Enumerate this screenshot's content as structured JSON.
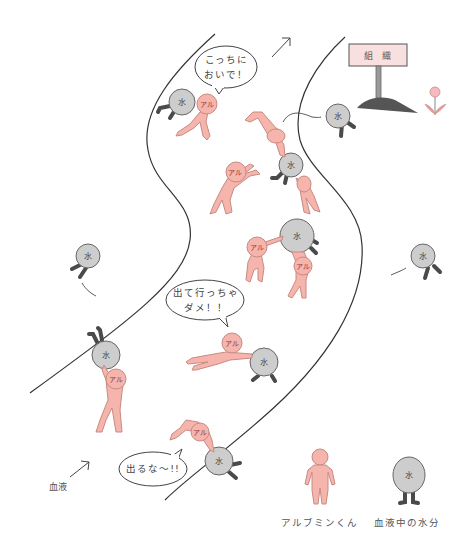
{
  "scene": {
    "title": "Albumin keeps water in the blood vessel",
    "sign": {
      "label": "組 織"
    },
    "river_label": "血液",
    "bubbles": [
      {
        "id": "come-here",
        "lines": [
          "こっちに",
          "おいで！"
        ]
      },
      {
        "id": "dont-leave",
        "lines": [
          "出て行っちゃ",
          "ダメ！！"
        ]
      },
      {
        "id": "dont-go-out",
        "lines": [
          "出るな～!!"
        ]
      }
    ],
    "tags": {
      "albumin": "アル",
      "water": "水"
    },
    "legend": [
      {
        "id": "albumin",
        "label": "アルブミンくん"
      },
      {
        "id": "water",
        "label": "血液中の水分"
      }
    ]
  },
  "colors": {
    "albumin_pink": "#f5b5ad",
    "albumin_outline": "#c98a82",
    "water_gray": "#cdcdcd",
    "water_outline": "#666666",
    "legs_dark": "#4a4a4a",
    "sign_fill": "#f9e0e0",
    "mound": "#555555",
    "line": "#333333"
  }
}
